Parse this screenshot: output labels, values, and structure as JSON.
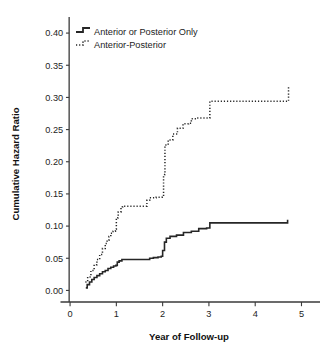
{
  "chart_data": {
    "type": "line",
    "title": "",
    "xlabel": "Year of Follow-up",
    "ylabel": "Cumulative Hazard Ratio",
    "xlim": [
      -0.25,
      5.4
    ],
    "ylim": [
      -0.018,
      0.425
    ],
    "xticks": [
      0,
      1,
      2,
      3,
      4,
      5
    ],
    "xtick_labels": [
      "0",
      "1",
      "2",
      "3",
      "4",
      "5"
    ],
    "yticks": [
      0.0,
      0.05,
      0.1,
      0.15,
      0.2,
      0.25,
      0.3,
      0.35,
      0.4
    ],
    "ytick_labels": [
      "0.00",
      "0.05",
      "0.10",
      "0.15",
      "0.20",
      "0.25",
      "0.30",
      "0.35",
      "0.40"
    ],
    "grid": false,
    "legend_position": "top-left",
    "step_style": "post",
    "series": [
      {
        "name": "Anterior or Posterior Only",
        "style": "solid",
        "color": "#262626",
        "x": [
          0.34,
          0.37,
          0.42,
          0.47,
          0.52,
          0.58,
          0.64,
          0.7,
          0.76,
          0.82,
          0.88,
          0.94,
          0.99,
          1.02,
          1.06,
          1.12,
          1.55,
          1.72,
          1.8,
          1.9,
          1.97,
          2.0,
          2.04,
          2.08,
          2.16,
          2.3,
          2.45,
          2.62,
          2.78,
          2.95,
          3.02,
          4.68,
          4.7
        ],
        "y": [
          0.004,
          0.009,
          0.013,
          0.017,
          0.02,
          0.023,
          0.026,
          0.029,
          0.031,
          0.034,
          0.036,
          0.038,
          0.039,
          0.044,
          0.046,
          0.048,
          0.048,
          0.05,
          0.051,
          0.052,
          0.053,
          0.062,
          0.075,
          0.081,
          0.084,
          0.086,
          0.09,
          0.092,
          0.096,
          0.097,
          0.105,
          0.105,
          0.11
        ]
      },
      {
        "name": "Anterior-Posterior",
        "style": "dotted",
        "color": "#262626",
        "x": [
          0.33,
          0.38,
          0.45,
          0.52,
          0.58,
          0.64,
          0.7,
          0.76,
          0.8,
          0.84,
          0.88,
          0.93,
          0.98,
          1.0,
          1.04,
          1.1,
          1.14,
          1.62,
          1.66,
          1.72,
          1.86,
          1.99,
          2.02,
          2.05,
          2.12,
          2.22,
          2.32,
          2.44,
          2.56,
          2.62,
          2.74,
          2.98,
          3.02,
          4.68,
          4.72
        ],
        "y": [
          0.013,
          0.021,
          0.031,
          0.04,
          0.048,
          0.056,
          0.065,
          0.073,
          0.078,
          0.084,
          0.089,
          0.092,
          0.095,
          0.113,
          0.122,
          0.13,
          0.131,
          0.131,
          0.14,
          0.144,
          0.145,
          0.146,
          0.18,
          0.226,
          0.234,
          0.243,
          0.252,
          0.259,
          0.26,
          0.267,
          0.268,
          0.268,
          0.294,
          0.294,
          0.318
        ]
      }
    ]
  },
  "legend": {
    "items": [
      {
        "label": "Anterior or Posterior Only",
        "marker": "solid-step-line-icon"
      },
      {
        "label": "Anterior-Posterior",
        "marker": "dotted-step-line-icon"
      }
    ]
  },
  "axes": {
    "x_title": "Year of Follow-up",
    "y_title": "Cumulative Hazard Ratio"
  }
}
